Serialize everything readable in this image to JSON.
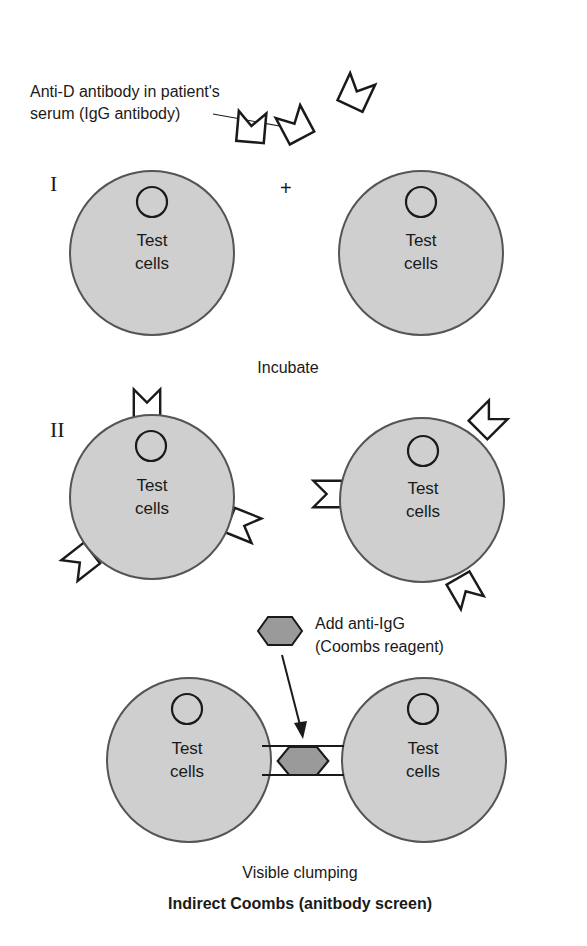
{
  "diagram": {
    "title": "Indirect Coombs (anitbody screen)",
    "annotation_antibody": {
      "line1": "Anti-D antibody in patient's",
      "line2": "serum (IgG antibody)"
    },
    "step1": {
      "numeral": "I",
      "plus": "+",
      "caption": "Incubate"
    },
    "step2": {
      "numeral": "II"
    },
    "step3": {
      "reagent_line1": "Add anti-IgG",
      "reagent_line2": "(Coombs reagent)",
      "caption": "Visible clumping"
    },
    "cell_label_line1": "Test",
    "cell_label_line2": "cells",
    "colors": {
      "cell_fill": "#cfcfcf",
      "cell_stroke": "#555555",
      "reagent_fill": "#9a9a9a",
      "line": "#1a1a1a",
      "background": "#ffffff"
    }
  }
}
